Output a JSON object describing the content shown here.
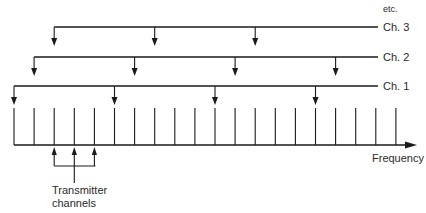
{
  "diagram": {
    "slot_count": 20,
    "axis_label": "Frequency",
    "continuation_label": "etc.",
    "channels": [
      {
        "label": "Ch. 1",
        "start_slot": 0,
        "step": 5,
        "arrow_slots": [
          0,
          5,
          10,
          15
        ]
      },
      {
        "label": "Ch. 2",
        "start_slot": 1,
        "step": 5,
        "arrow_slots": [
          1,
          6,
          11,
          16
        ]
      },
      {
        "label": "Ch. 3",
        "start_slot": 2,
        "step": 5,
        "arrow_slots": [
          2,
          7,
          12
        ]
      }
    ],
    "transmitter": {
      "label_line1": "Transmitter",
      "label_line2": "channels",
      "slots": [
        2,
        3,
        4
      ]
    }
  }
}
